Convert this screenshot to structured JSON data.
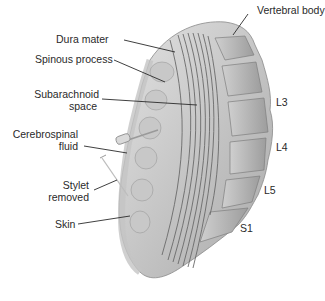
{
  "diagram": {
    "labels": {
      "dura_mater": "Dura mater",
      "spinous_process": "Spinous process",
      "subarachnoid_space_1": "Subarachnoid",
      "subarachnoid_space_2": "space",
      "csf_1": "Cerebrospinal",
      "csf_2": "fluid",
      "stylet_1": "Stylet",
      "stylet_2": "removed",
      "skin": "Skin",
      "vertebral_body": "Vertebral body",
      "l3": "L3",
      "l4": "L4",
      "l5": "L5",
      "s1": "S1"
    },
    "colors": {
      "tissue_light": "#d9d9d9",
      "tissue_mid": "#b5b5b5",
      "tissue_dark": "#8a8a8a",
      "nerve_lines": "#6a6a6a",
      "leader_lines": "#2a2a2a",
      "background": "#ffffff"
    }
  }
}
